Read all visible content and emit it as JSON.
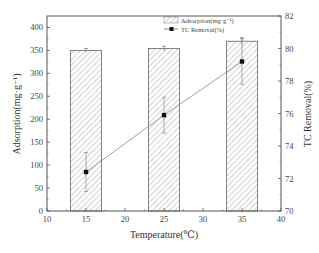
{
  "chart_data": {
    "type": "bar+line",
    "title": "",
    "xlabel": "Temperature(℃)",
    "ylabel_left": "Adsorption(mg·g⁻¹)",
    "ylabel_right": "TC Removal(%)",
    "xlim": [
      10,
      40
    ],
    "ylim_left": [
      0,
      425
    ],
    "ylim_right": [
      70,
      82
    ],
    "x_ticks": [
      "10",
      "15",
      "20",
      "25",
      "30",
      "35",
      "40"
    ],
    "y_left_ticks": [
      "0",
      "50",
      "100",
      "150",
      "200",
      "250",
      "300",
      "350",
      "400"
    ],
    "y_right_ticks": [
      "70",
      "72",
      "74",
      "76",
      "78",
      "80",
      "82"
    ],
    "categories": [
      15,
      25,
      35
    ],
    "series": [
      {
        "name": "Adsorption(mg·g⁻¹)",
        "type": "bar",
        "axis": "left",
        "pattern": "hatched",
        "values": [
          350,
          354,
          370
        ],
        "errors": [
          4,
          5,
          8
        ]
      },
      {
        "name": "TC Removal(%)",
        "type": "line",
        "axis": "right",
        "marker": "square",
        "values": [
          72.4,
          75.9,
          79.2
        ],
        "errors": [
          1.2,
          1.1,
          1.4
        ]
      }
    ],
    "legend": {
      "position": "top-center-right",
      "entries": [
        "Adsorption(mg·g⁻¹)",
        "TC Removal(%)"
      ]
    },
    "grid": false
  }
}
